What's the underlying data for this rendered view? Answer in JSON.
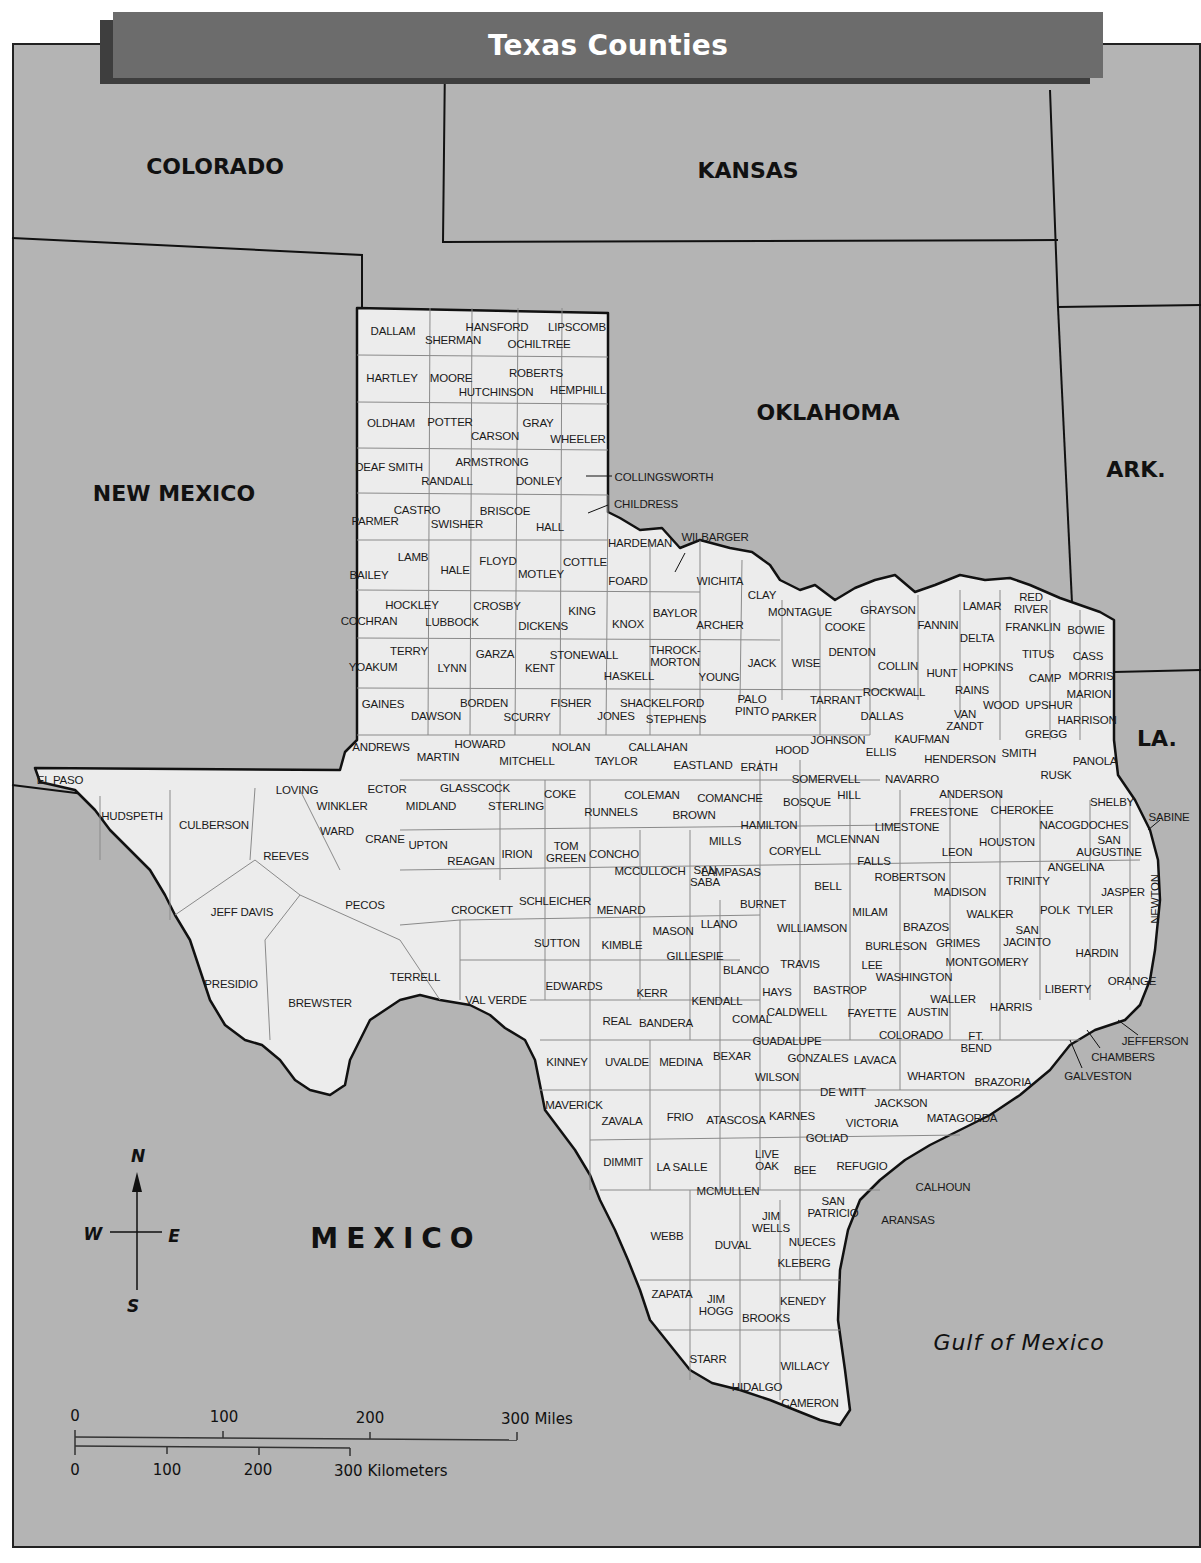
{
  "title": "Texas Counties",
  "colors": {
    "land": "#ececec",
    "neighbor": "#b4b4b4",
    "title_bar": "#6c6c6c",
    "title_shadow": "#3e3e3e",
    "border": "#111111",
    "county_line": "#8a8a8a"
  },
  "regions": {
    "colorado": "COLORADO",
    "kansas": "KANSAS",
    "new_mexico": "NEW MEXICO",
    "oklahoma": "OKLAHOMA",
    "arkansas": "ARK.",
    "louisiana": "LA.",
    "mexico": "MEXICO",
    "gulf": "Gulf of Mexico"
  },
  "compass": {
    "n": "N",
    "s": "S",
    "e": "E",
    "w": "W"
  },
  "scale": {
    "miles": {
      "ticks": [
        "0",
        "100",
        "200"
      ],
      "end_label": "300 Miles"
    },
    "kilometers": {
      "ticks": [
        "0",
        "100",
        "200"
      ],
      "end_label": "300 Kilometers"
    }
  },
  "counties": [
    {
      "name": "DALLAM",
      "x": 393,
      "y": 331
    },
    {
      "name": "HANSFORD",
      "x": 497,
      "y": 327
    },
    {
      "name": "LIPSCOMB",
      "x": 577,
      "y": 327
    },
    {
      "name": "SHERMAN",
      "x": 453,
      "y": 340
    },
    {
      "name": "OCHILTREE",
      "x": 539,
      "y": 344
    },
    {
      "name": "HARTLEY",
      "x": 392,
      "y": 378
    },
    {
      "name": "MOORE",
      "x": 451,
      "y": 378
    },
    {
      "name": "ROBERTS",
      "x": 536,
      "y": 373
    },
    {
      "name": "HUTCHINSON",
      "x": 496,
      "y": 392
    },
    {
      "name": "HEMPHILL",
      "x": 578,
      "y": 390
    },
    {
      "name": "OLDHAM",
      "x": 391,
      "y": 423
    },
    {
      "name": "POTTER",
      "x": 450,
      "y": 422
    },
    {
      "name": "GRAY",
      "x": 538,
      "y": 423
    },
    {
      "name": "CARSON",
      "x": 495,
      "y": 436
    },
    {
      "name": "WHEELER",
      "x": 578,
      "y": 439
    },
    {
      "name": "DEAF SMITH",
      "x": 389,
      "y": 467
    },
    {
      "name": "ARMSTRONG",
      "x": 492,
      "y": 462
    },
    {
      "name": "RANDALL",
      "x": 447,
      "y": 481
    },
    {
      "name": "DONLEY",
      "x": 539,
      "y": 481
    },
    {
      "name": "COLLINGSWORTH",
      "x": 664,
      "y": 477
    },
    {
      "name": "CHILDRESS",
      "x": 646,
      "y": 504
    },
    {
      "name": "CASTRO",
      "x": 417,
      "y": 510
    },
    {
      "name": "BRISCOE",
      "x": 505,
      "y": 511
    },
    {
      "name": "PARMER",
      "x": 375,
      "y": 521
    },
    {
      "name": "SWISHER",
      "x": 457,
      "y": 524
    },
    {
      "name": "HALL",
      "x": 550,
      "y": 527
    },
    {
      "name": "HARDEMAN",
      "x": 640,
      "y": 543
    },
    {
      "name": "WILBARGER",
      "x": 715,
      "y": 537
    },
    {
      "name": "LAMB",
      "x": 413,
      "y": 557
    },
    {
      "name": "HALE",
      "x": 455,
      "y": 570
    },
    {
      "name": "FLOYD",
      "x": 498,
      "y": 561
    },
    {
      "name": "COTTLE",
      "x": 585,
      "y": 562
    },
    {
      "name": "MOTLEY",
      "x": 541,
      "y": 574
    },
    {
      "name": "BAILEY",
      "x": 369,
      "y": 575
    },
    {
      "name": "FOARD",
      "x": 628,
      "y": 581
    },
    {
      "name": "WICHITA",
      "x": 720,
      "y": 581
    },
    {
      "name": "CLAY",
      "x": 762,
      "y": 595
    },
    {
      "name": "HOCKLEY",
      "x": 412,
      "y": 605
    },
    {
      "name": "CROSBY",
      "x": 497,
      "y": 606
    },
    {
      "name": "KING",
      "x": 582,
      "y": 611
    },
    {
      "name": "BAYLOR",
      "x": 675,
      "y": 613
    },
    {
      "name": "MONTAGUE",
      "x": 800,
      "y": 612
    },
    {
      "name": "GRAYSON",
      "x": 888,
      "y": 610
    },
    {
      "name": "LAMAR",
      "x": 982,
      "y": 606
    },
    {
      "name": "RED RIVER",
      "x": 1031,
      "y": 603,
      "multiline": [
        "RED",
        "RIVER"
      ]
    },
    {
      "name": "COCHRAN",
      "x": 369,
      "y": 621
    },
    {
      "name": "LUBBOCK",
      "x": 452,
      "y": 622
    },
    {
      "name": "DICKENS",
      "x": 543,
      "y": 626
    },
    {
      "name": "KNOX",
      "x": 628,
      "y": 624
    },
    {
      "name": "ARCHER",
      "x": 720,
      "y": 625
    },
    {
      "name": "COOKE",
      "x": 845,
      "y": 627
    },
    {
      "name": "FANNIN",
      "x": 938,
      "y": 625
    },
    {
      "name": "FRANKLIN",
      "x": 1033,
      "y": 627
    },
    {
      "name": "BOWIE",
      "x": 1086,
      "y": 630
    },
    {
      "name": "DELTA",
      "x": 977,
      "y": 638
    },
    {
      "name": "TERRY",
      "x": 409,
      "y": 651
    },
    {
      "name": "GARZA",
      "x": 495,
      "y": 654
    },
    {
      "name": "STONEWALL",
      "x": 584,
      "y": 655
    },
    {
      "name": "THROCK-MORTON",
      "x": 675,
      "y": 656,
      "multiline": [
        "THROCK-",
        "MORTON"
      ]
    },
    {
      "name": "TITUS",
      "x": 1038,
      "y": 654
    },
    {
      "name": "CASS",
      "x": 1088,
      "y": 656
    },
    {
      "name": "YOAKUM",
      "x": 373,
      "y": 667
    },
    {
      "name": "LYNN",
      "x": 452,
      "y": 668
    },
    {
      "name": "KENT",
      "x": 540,
      "y": 668
    },
    {
      "name": "HASKELL",
      "x": 629,
      "y": 676
    },
    {
      "name": "YOUNG",
      "x": 719,
      "y": 677
    },
    {
      "name": "JACK",
      "x": 762,
      "y": 663
    },
    {
      "name": "WISE",
      "x": 806,
      "y": 663
    },
    {
      "name": "DENTON",
      "x": 852,
      "y": 652
    },
    {
      "name": "COLLIN",
      "x": 898,
      "y": 666
    },
    {
      "name": "HUNT",
      "x": 942,
      "y": 673
    },
    {
      "name": "HOPKINS",
      "x": 988,
      "y": 667
    },
    {
      "name": "CAMP",
      "x": 1045,
      "y": 678
    },
    {
      "name": "MORRIS",
      "x": 1091,
      "y": 676
    },
    {
      "name": "GAINES",
      "x": 383,
      "y": 704
    },
    {
      "name": "BORDEN",
      "x": 484,
      "y": 703
    },
    {
      "name": "FISHER",
      "x": 571,
      "y": 703
    },
    {
      "name": "SHACKELFORD",
      "x": 662,
      "y": 703
    },
    {
      "name": "PALO PINTO",
      "x": 752,
      "y": 705,
      "multiline": [
        "PALO",
        "PINTO"
      ]
    },
    {
      "name": "TARRANT",
      "x": 836,
      "y": 700
    },
    {
      "name": "ROCKWALL",
      "x": 894,
      "y": 692
    },
    {
      "name": "RAINS",
      "x": 972,
      "y": 690
    },
    {
      "name": "MARION",
      "x": 1089,
      "y": 694
    },
    {
      "name": "DAWSON",
      "x": 436,
      "y": 716
    },
    {
      "name": "SCURRY",
      "x": 527,
      "y": 717
    },
    {
      "name": "JONES",
      "x": 616,
      "y": 716
    },
    {
      "name": "STEPHENS",
      "x": 676,
      "y": 719
    },
    {
      "name": "PARKER",
      "x": 794,
      "y": 717
    },
    {
      "name": "DALLAS",
      "x": 882,
      "y": 716
    },
    {
      "name": "WOOD",
      "x": 1001,
      "y": 705
    },
    {
      "name": "UPSHUR",
      "x": 1049,
      "y": 705
    },
    {
      "name": "VAN ZANDT",
      "x": 965,
      "y": 720,
      "multiline": [
        "VAN",
        "ZANDT"
      ]
    },
    {
      "name": "HARRISON",
      "x": 1087,
      "y": 720
    },
    {
      "name": "ANDREWS",
      "x": 381,
      "y": 747
    },
    {
      "name": "HOWARD",
      "x": 480,
      "y": 744
    },
    {
      "name": "NOLAN",
      "x": 571,
      "y": 747
    },
    {
      "name": "CALLAHAN",
      "x": 658,
      "y": 747
    },
    {
      "name": "JOHNSON",
      "x": 838,
      "y": 740
    },
    {
      "name": "KAUFMAN",
      "x": 922,
      "y": 739
    },
    {
      "name": "GREGG",
      "x": 1046,
      "y": 734
    },
    {
      "name": "MARTIN",
      "x": 438,
      "y": 757
    },
    {
      "name": "MITCHELL",
      "x": 527,
      "y": 761
    },
    {
      "name": "TAYLOR",
      "x": 616,
      "y": 761
    },
    {
      "name": "HOOD",
      "x": 792,
      "y": 750
    },
    {
      "name": "ELLIS",
      "x": 881,
      "y": 752
    },
    {
      "name": "SMITH",
      "x": 1019,
      "y": 753
    },
    {
      "name": "HENDERSON",
      "x": 960,
      "y": 759
    },
    {
      "name": "RUSK",
      "x": 1056,
      "y": 775
    },
    {
      "name": "PANOLA",
      "x": 1095,
      "y": 761
    },
    {
      "name": "EL PASO",
      "x": 60,
      "y": 780
    },
    {
      "name": "LOVING",
      "x": 297,
      "y": 790
    },
    {
      "name": "ECTOR",
      "x": 387,
      "y": 789
    },
    {
      "name": "GLASSCOCK",
      "x": 475,
      "y": 788
    },
    {
      "name": "COKE",
      "x": 560,
      "y": 794
    },
    {
      "name": "COLEMAN",
      "x": 652,
      "y": 795
    },
    {
      "name": "EASTLAND",
      "x": 703,
      "y": 765
    },
    {
      "name": "ERATH",
      "x": 759,
      "y": 767
    },
    {
      "name": "SOMERVELL",
      "x": 826,
      "y": 779
    },
    {
      "name": "NAVARRO",
      "x": 912,
      "y": 779
    },
    {
      "name": "ANDERSON",
      "x": 971,
      "y": 794
    },
    {
      "name": "WINKLER",
      "x": 342,
      "y": 806
    },
    {
      "name": "MIDLAND",
      "x": 431,
      "y": 806
    },
    {
      "name": "STERLING",
      "x": 516,
      "y": 806
    },
    {
      "name": "RUNNELS",
      "x": 611,
      "y": 812
    },
    {
      "name": "BROWN",
      "x": 694,
      "y": 815
    },
    {
      "name": "COMANCHE",
      "x": 730,
      "y": 798
    },
    {
      "name": "BOSQUE",
      "x": 807,
      "y": 802
    },
    {
      "name": "HILL",
      "x": 849,
      "y": 795
    },
    {
      "name": "FREESTONE",
      "x": 944,
      "y": 812
    },
    {
      "name": "CHEROKEE",
      "x": 1022,
      "y": 810
    },
    {
      "name": "SHELBY",
      "x": 1112,
      "y": 802
    },
    {
      "name": "SABINE",
      "x": 1169,
      "y": 817
    },
    {
      "name": "HUDSPETH",
      "x": 132,
      "y": 816
    },
    {
      "name": "CULBERSON",
      "x": 214,
      "y": 825
    },
    {
      "name": "WARD",
      "x": 337,
      "y": 831
    },
    {
      "name": "CRANE",
      "x": 385,
      "y": 839
    },
    {
      "name": "UPTON",
      "x": 428,
      "y": 845
    },
    {
      "name": "MILLS",
      "x": 725,
      "y": 841
    },
    {
      "name": "HAMILTON",
      "x": 769,
      "y": 825
    },
    {
      "name": "MCLENNAN",
      "x": 848,
      "y": 839
    },
    {
      "name": "LIMESTONE",
      "x": 907,
      "y": 827
    },
    {
      "name": "HOUSTON",
      "x": 1007,
      "y": 842
    },
    {
      "name": "NACOGDOCHES",
      "x": 1084,
      "y": 825
    },
    {
      "name": "SAN AUGUSTINE",
      "x": 1109,
      "y": 846,
      "multiline": [
        "SAN",
        "AUGUSTINE"
      ]
    },
    {
      "name": "REEVES",
      "x": 286,
      "y": 856
    },
    {
      "name": "REAGAN",
      "x": 471,
      "y": 861
    },
    {
      "name": "IRION",
      "x": 517,
      "y": 854
    },
    {
      "name": "TOM GREEN",
      "x": 566,
      "y": 852,
      "multiline": [
        "TOM",
        "GREEN"
      ]
    },
    {
      "name": "CONCHO",
      "x": 614,
      "y": 854
    },
    {
      "name": "MCCULLOCH",
      "x": 650,
      "y": 871
    },
    {
      "name": "SAN SABA",
      "x": 705,
      "y": 876,
      "multiline": [
        "SAN",
        "SABA"
      ]
    },
    {
      "name": "LAMPASAS",
      "x": 731,
      "y": 872
    },
    {
      "name": "CORYELL",
      "x": 795,
      "y": 851
    },
    {
      "name": "FALLS",
      "x": 874,
      "y": 861
    },
    {
      "name": "LEON",
      "x": 957,
      "y": 852
    },
    {
      "name": "ANGELINA",
      "x": 1076,
      "y": 867
    },
    {
      "name": "ROBERTSON",
      "x": 910,
      "y": 877
    },
    {
      "name": "BELL",
      "x": 828,
      "y": 886
    },
    {
      "name": "MADISON",
      "x": 960,
      "y": 892
    },
    {
      "name": "TRINITY",
      "x": 1028,
      "y": 881
    },
    {
      "name": "JASPER",
      "x": 1123,
      "y": 892
    },
    {
      "name": "NEWTON",
      "x": 1155,
      "y": 899,
      "vertical": true
    },
    {
      "name": "JEFF DAVIS",
      "x": 242,
      "y": 912
    },
    {
      "name": "PECOS",
      "x": 365,
      "y": 905
    },
    {
      "name": "CROCKETT",
      "x": 482,
      "y": 910
    },
    {
      "name": "SCHLEICHER",
      "x": 555,
      "y": 901
    },
    {
      "name": "MENARD",
      "x": 621,
      "y": 910
    },
    {
      "name": "MASON",
      "x": 673,
      "y": 931
    },
    {
      "name": "LLANO",
      "x": 719,
      "y": 924
    },
    {
      "name": "BURNET",
      "x": 763,
      "y": 904
    },
    {
      "name": "MILAM",
      "x": 870,
      "y": 912
    },
    {
      "name": "WALKER",
      "x": 990,
      "y": 914
    },
    {
      "name": "POLK",
      "x": 1055,
      "y": 910
    },
    {
      "name": "TYLER",
      "x": 1095,
      "y": 910
    },
    {
      "name": "WILLIAMSON",
      "x": 812,
      "y": 928
    },
    {
      "name": "BRAZOS",
      "x": 926,
      "y": 927
    },
    {
      "name": "SAN JACINTO",
      "x": 1027,
      "y": 936,
      "multiline": [
        "SAN",
        "JACINTO"
      ]
    },
    {
      "name": "SUTTON",
      "x": 557,
      "y": 943
    },
    {
      "name": "KIMBLE",
      "x": 622,
      "y": 945
    },
    {
      "name": "BURLESON",
      "x": 896,
      "y": 946
    },
    {
      "name": "GRIMES",
      "x": 958,
      "y": 943
    },
    {
      "name": "HARDIN",
      "x": 1097,
      "y": 953
    },
    {
      "name": "GILLESPIE",
      "x": 695,
      "y": 956
    },
    {
      "name": "PRESIDIO",
      "x": 231,
      "y": 984
    },
    {
      "name": "TERRELL",
      "x": 415,
      "y": 977
    },
    {
      "name": "BREWSTER",
      "x": 320,
      "y": 1003
    },
    {
      "name": "VAL VERDE",
      "x": 496,
      "y": 1000
    },
    {
      "name": "EDWARDS",
      "x": 574,
      "y": 986
    },
    {
      "name": "BLANCO",
      "x": 746,
      "y": 970
    },
    {
      "name": "TRAVIS",
      "x": 800,
      "y": 964
    },
    {
      "name": "LEE",
      "x": 872,
      "y": 965
    },
    {
      "name": "MONTGOMERY",
      "x": 987,
      "y": 962
    },
    {
      "name": "WASHINGTON",
      "x": 914,
      "y": 977
    },
    {
      "name": "LIBERTY",
      "x": 1068,
      "y": 989
    },
    {
      "name": "ORANGE",
      "x": 1132,
      "y": 981
    },
    {
      "name": "KERR",
      "x": 652,
      "y": 993
    },
    {
      "name": "HAYS",
      "x": 777,
      "y": 992
    },
    {
      "name": "BASTROP",
      "x": 840,
      "y": 990
    },
    {
      "name": "KENDALL",
      "x": 717,
      "y": 1001
    },
    {
      "name": "WALLER",
      "x": 953,
      "y": 999
    },
    {
      "name": "HARRIS",
      "x": 1011,
      "y": 1007
    },
    {
      "name": "REAL",
      "x": 617,
      "y": 1021
    },
    {
      "name": "BANDERA",
      "x": 666,
      "y": 1023
    },
    {
      "name": "COMAL",
      "x": 752,
      "y": 1019
    },
    {
      "name": "CALDWELL",
      "x": 797,
      "y": 1012
    },
    {
      "name": "FAYETTE",
      "x": 872,
      "y": 1013
    },
    {
      "name": "AUSTIN",
      "x": 928,
      "y": 1012
    },
    {
      "name": "COLORADO",
      "x": 911,
      "y": 1035
    },
    {
      "name": "FT. BEND",
      "x": 976,
      "y": 1042,
      "multiline": [
        "FT.",
        "BEND"
      ]
    },
    {
      "name": "JEFFERSON",
      "x": 1155,
      "y": 1041
    },
    {
      "name": "CHAMBERS",
      "x": 1123,
      "y": 1057
    },
    {
      "name": "GUADALUPE",
      "x": 787,
      "y": 1041
    },
    {
      "name": "KINNEY",
      "x": 567,
      "y": 1062
    },
    {
      "name": "UVALDE",
      "x": 627,
      "y": 1062
    },
    {
      "name": "MEDINA",
      "x": 681,
      "y": 1062
    },
    {
      "name": "BEXAR",
      "x": 732,
      "y": 1056
    },
    {
      "name": "GONZALES",
      "x": 818,
      "y": 1058
    },
    {
      "name": "LAVACA",
      "x": 875,
      "y": 1060
    },
    {
      "name": "WILSON",
      "x": 777,
      "y": 1077
    },
    {
      "name": "WHARTON",
      "x": 936,
      "y": 1076
    },
    {
      "name": "BRAZORIA",
      "x": 1003,
      "y": 1082
    },
    {
      "name": "GALVESTON",
      "x": 1098,
      "y": 1076
    },
    {
      "name": "DE WITT",
      "x": 843,
      "y": 1092
    },
    {
      "name": "MAVERICK",
      "x": 574,
      "y": 1105
    },
    {
      "name": "FRIO",
      "x": 680,
      "y": 1117
    },
    {
      "name": "ATASCOSA",
      "x": 736,
      "y": 1120
    },
    {
      "name": "KARNES",
      "x": 792,
      "y": 1116
    },
    {
      "name": "JACKSON",
      "x": 901,
      "y": 1103
    },
    {
      "name": "ZAVALA",
      "x": 622,
      "y": 1121
    },
    {
      "name": "VICTORIA",
      "x": 872,
      "y": 1123
    },
    {
      "name": "MATAGORDA",
      "x": 962,
      "y": 1118
    },
    {
      "name": "GOLIAD",
      "x": 827,
      "y": 1138
    },
    {
      "name": "DIMMIT",
      "x": 623,
      "y": 1162
    },
    {
      "name": "LA SALLE",
      "x": 682,
      "y": 1167
    },
    {
      "name": "LIVE OAK",
      "x": 767,
      "y": 1160,
      "multiline": [
        "LIVE",
        "OAK"
      ]
    },
    {
      "name": "BEE",
      "x": 805,
      "y": 1170
    },
    {
      "name": "REFUGIO",
      "x": 862,
      "y": 1166
    },
    {
      "name": "CALHOUN",
      "x": 943,
      "y": 1187
    },
    {
      "name": "MCMULLEN",
      "x": 728,
      "y": 1191
    },
    {
      "name": "SAN PATRICIO",
      "x": 833,
      "y": 1207,
      "multiline": [
        "SAN",
        "PATRICIO"
      ]
    },
    {
      "name": "ARANSAS",
      "x": 908,
      "y": 1220
    },
    {
      "name": "JIM WELLS",
      "x": 771,
      "y": 1222,
      "multiline": [
        "JIM",
        "WELLS"
      ]
    },
    {
      "name": "WEBB",
      "x": 667,
      "y": 1236
    },
    {
      "name": "DUVAL",
      "x": 733,
      "y": 1245
    },
    {
      "name": "NUECES",
      "x": 812,
      "y": 1242
    },
    {
      "name": "KLEBERG",
      "x": 804,
      "y": 1263
    },
    {
      "name": "ZAPATA",
      "x": 672,
      "y": 1294
    },
    {
      "name": "JIM HOGG",
      "x": 716,
      "y": 1305,
      "multiline": [
        "JIM",
        "HOGG"
      ]
    },
    {
      "name": "KENEDY",
      "x": 803,
      "y": 1301
    },
    {
      "name": "BROOKS",
      "x": 766,
      "y": 1318
    },
    {
      "name": "STARR",
      "x": 708,
      "y": 1359
    },
    {
      "name": "WILLACY",
      "x": 805,
      "y": 1366
    },
    {
      "name": "HIDALGO",
      "x": 757,
      "y": 1387
    },
    {
      "name": "CAMERON",
      "x": 810,
      "y": 1403
    }
  ]
}
